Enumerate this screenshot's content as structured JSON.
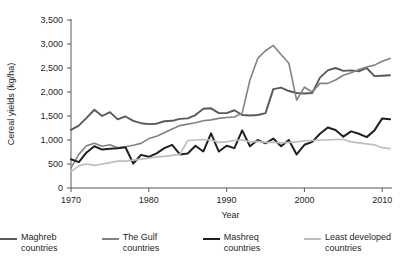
{
  "chart_data": {
    "type": "line",
    "title": "",
    "xlabel": "Year",
    "ylabel": "Cereal yields (kg/ha)",
    "xlim": [
      1970,
      2011
    ],
    "ylim": [
      0,
      3500
    ],
    "xticks": [
      1970,
      1980,
      1990,
      2000,
      2010
    ],
    "xtick_labels": [
      "1970",
      "1980",
      "1990",
      "2000",
      "2010"
    ],
    "yticks": [
      0,
      500,
      1000,
      1500,
      2000,
      2500,
      3000,
      3500
    ],
    "ytick_labels": [
      "0",
      "500",
      "1,000",
      "1,500",
      "2,000",
      "2,500",
      "3,000",
      "3,500"
    ],
    "grid": false,
    "legend_position": "bottom",
    "x": [
      1970,
      1971,
      1972,
      1973,
      1974,
      1975,
      1976,
      1977,
      1978,
      1979,
      1980,
      1981,
      1982,
      1983,
      1984,
      1985,
      1986,
      1987,
      1988,
      1989,
      1990,
      1991,
      1992,
      1993,
      1994,
      1995,
      1996,
      1997,
      1998,
      1999,
      2000,
      2001,
      2002,
      2003,
      2004,
      2005,
      2006,
      2007,
      2008,
      2009,
      2010,
      2011
    ],
    "series": [
      {
        "name": "Maghreb countries",
        "color": "#58595b",
        "width": 1.9,
        "values": [
          1210,
          1300,
          1460,
          1630,
          1500,
          1580,
          1430,
          1490,
          1400,
          1350,
          1330,
          1340,
          1390,
          1400,
          1440,
          1450,
          1520,
          1650,
          1660,
          1560,
          1560,
          1620,
          1520,
          1510,
          1520,
          1560,
          2060,
          2090,
          2020,
          1980,
          1970,
          1980,
          2300,
          2450,
          2500,
          2440,
          2450,
          2430,
          2500,
          2330,
          2340,
          2350
        ]
      },
      {
        "name": "The Gulf countries",
        "color": "#808285",
        "width": 1.6,
        "values": [
          420,
          700,
          880,
          930,
          870,
          900,
          840,
          860,
          890,
          930,
          1030,
          1080,
          1150,
          1230,
          1300,
          1330,
          1360,
          1400,
          1420,
          1450,
          1470,
          1480,
          1560,
          2250,
          2700,
          2860,
          2970,
          2780,
          2600,
          1830,
          2100,
          2000,
          2180,
          2180,
          2250,
          2350,
          2400,
          2470,
          2520,
          2560,
          2640,
          2700
        ]
      },
      {
        "name": "Mashreq countries",
        "color": "#231f20",
        "width": 2.0,
        "values": [
          600,
          540,
          740,
          870,
          800,
          820,
          830,
          850,
          510,
          690,
          650,
          720,
          830,
          900,
          700,
          720,
          880,
          760,
          1140,
          760,
          880,
          830,
          1200,
          870,
          1000,
          930,
          1030,
          870,
          1000,
          700,
          900,
          960,
          1130,
          1260,
          1210,
          1070,
          1180,
          1130,
          1060,
          1200,
          1450,
          1430
        ]
      },
      {
        "name": "Least developed countries",
        "color": "#bcbec0",
        "width": 1.7,
        "values": [
          340,
          460,
          500,
          470,
          500,
          530,
          560,
          560,
          580,
          600,
          620,
          650,
          660,
          680,
          700,
          990,
          1000,
          1010,
          1000,
          950,
          960,
          990,
          1000,
          960,
          970,
          950,
          950,
          940,
          950,
          960,
          980,
          990,
          1000,
          1000,
          1010,
          1010,
          960,
          940,
          920,
          900,
          840,
          820
        ]
      }
    ],
    "annotations": []
  },
  "legend": {
    "items": [
      {
        "label": "Maghreb countries",
        "color": "#58595b",
        "width": 2
      },
      {
        "label": "The Gulf countries",
        "color": "#808285",
        "width": 2
      },
      {
        "label": "Mashreq countries",
        "color": "#231f20",
        "width": 2
      },
      {
        "label": "Least developed countries",
        "color": "#bcbec0",
        "width": 2
      }
    ]
  }
}
